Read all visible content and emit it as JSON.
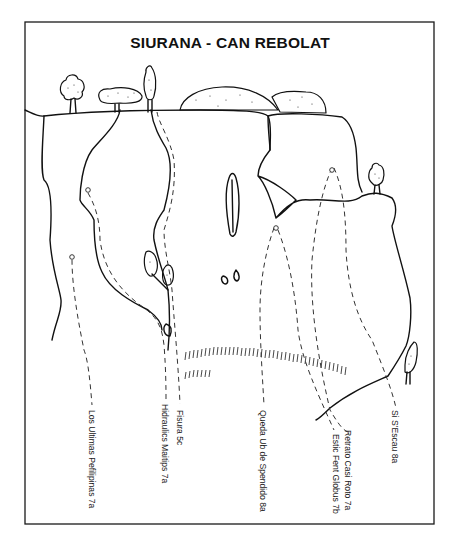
{
  "title": "SIURANA - CAN REBOLAT",
  "routes": [
    {
      "name": "Los Ultimas Pefilipinas 7a",
      "x": 95,
      "y": 410
    },
    {
      "name": "Hidraulics Maitips 7a",
      "x": 168,
      "y": 404
    },
    {
      "name": "Fisura 5c",
      "x": 183,
      "y": 408
    },
    {
      "name": "Queda Ub de Spendido 8a",
      "x": 266,
      "y": 410
    },
    {
      "name": "Retrato Casi Roto 7a",
      "x": 351,
      "y": 430
    },
    {
      "name": "Estic Fent Globus 7b",
      "x": 339,
      "y": 434
    },
    {
      "name": "Si S'Escau 8a",
      "x": 398,
      "y": 410
    }
  ],
  "colors": {
    "ink": "#111111",
    "background": "#ffffff"
  }
}
